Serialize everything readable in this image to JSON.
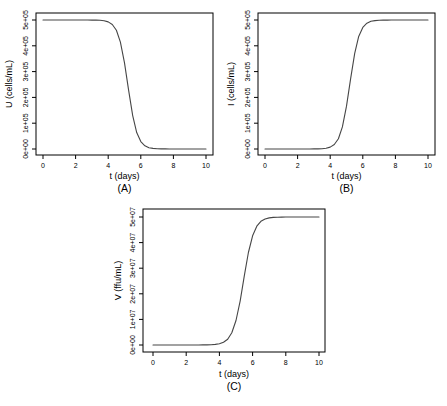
{
  "figure": {
    "background": "#ffffff",
    "axis_color": "#000000",
    "text_color": "#000000"
  },
  "chart_data": [
    {
      "id": "A",
      "type": "line",
      "caption": "(A)",
      "xlabel": "t (days)",
      "ylabel": "U (cells/mL)",
      "xlim": [
        0,
        10
      ],
      "ylim": [
        0,
        500000
      ],
      "grid": false,
      "legend": "none",
      "xtick_values": [
        0,
        2,
        4,
        6,
        8,
        10
      ],
      "xtick_labels": [
        "0",
        "2",
        "4",
        "6",
        "8",
        "10"
      ],
      "ytick_values": [
        0,
        100000,
        200000,
        300000,
        400000,
        500000
      ],
      "ytick_labels": [
        "0e+00",
        "1e+05",
        "2e+05",
        "3e+05",
        "4e+05",
        "5e+05"
      ],
      "line_color": "#464646",
      "series": [
        {
          "name": "U",
          "x": [
            0,
            0.25,
            0.5,
            0.75,
            1,
            1.25,
            1.5,
            1.75,
            2,
            2.25,
            2.5,
            2.75,
            3,
            3.25,
            3.5,
            3.75,
            4,
            4.25,
            4.5,
            4.75,
            5,
            5.25,
            5.5,
            5.75,
            6,
            6.25,
            6.5,
            6.75,
            7,
            7.25,
            7.5,
            7.75,
            8,
            8.25,
            8.5,
            8.75,
            9,
            9.25,
            9.5,
            9.75,
            10
          ],
          "y": [
            500000,
            500000,
            500000,
            500000,
            500000,
            500000,
            500000,
            500000,
            500000,
            500000,
            500000,
            499900,
            499800,
            499500,
            498700,
            496900,
            492600,
            482700,
            460300,
            414200,
            334100,
            228200,
            129600,
            63600,
            28700,
            12300,
            5200,
            2200,
            900,
            400,
            200,
            100,
            0,
            0,
            0,
            0,
            0,
            0,
            0,
            0,
            0
          ]
        }
      ]
    },
    {
      "id": "B",
      "type": "line",
      "caption": "(B)",
      "xlabel": "t (days)",
      "ylabel": "I (cells/mL)",
      "xlim": [
        0,
        10
      ],
      "ylim": [
        0,
        500000
      ],
      "grid": false,
      "legend": "none",
      "xtick_values": [
        0,
        2,
        4,
        6,
        8,
        10
      ],
      "xtick_labels": [
        "0",
        "2",
        "4",
        "6",
        "8",
        "10"
      ],
      "ytick_values": [
        0,
        100000,
        200000,
        300000,
        400000,
        500000
      ],
      "ytick_labels": [
        "0e+00",
        "1e+05",
        "2e+05",
        "3e+05",
        "4e+05",
        "5e+05"
      ],
      "line_color": "#464646",
      "series": [
        {
          "name": "I",
          "x": [
            0,
            0.25,
            0.5,
            0.75,
            1,
            1.25,
            1.5,
            1.75,
            2,
            2.25,
            2.5,
            2.75,
            3,
            3.25,
            3.5,
            3.75,
            4,
            4.25,
            4.5,
            4.75,
            5,
            5.25,
            5.5,
            5.75,
            6,
            6.25,
            6.5,
            6.75,
            7,
            7.25,
            7.5,
            7.75,
            8,
            8.25,
            8.5,
            8.75,
            9,
            9.25,
            9.5,
            9.75,
            10
          ],
          "y": [
            0,
            0,
            0,
            0,
            0,
            0,
            0,
            0,
            0,
            0,
            0,
            100,
            200,
            500,
            1300,
            3100,
            7400,
            17300,
            39700,
            85800,
            165900,
            271800,
            370400,
            436400,
            471300,
            487700,
            494800,
            497800,
            499100,
            499600,
            499800,
            499900,
            500000,
            500000,
            500000,
            500000,
            500000,
            500000,
            500000,
            500000,
            500000
          ]
        }
      ]
    },
    {
      "id": "C",
      "type": "line",
      "caption": "(C)",
      "xlabel": "t (days)",
      "ylabel": "V (ffu/mL)",
      "xlim": [
        0,
        10
      ],
      "ylim": [
        0,
        50000000
      ],
      "grid": false,
      "legend": "none",
      "xtick_values": [
        0,
        2,
        4,
        6,
        8,
        10
      ],
      "xtick_labels": [
        "0",
        "2",
        "4",
        "6",
        "8",
        "10"
      ],
      "ytick_values": [
        0,
        10000000,
        20000000,
        30000000,
        40000000,
        50000000
      ],
      "ytick_labels": [
        "0e+00",
        "1e+07",
        "2e+07",
        "3e+07",
        "4e+07",
        "5e+07"
      ],
      "line_color": "#464646",
      "series": [
        {
          "name": "V",
          "x": [
            0,
            0.25,
            0.5,
            0.75,
            1,
            1.25,
            1.5,
            1.75,
            2,
            2.25,
            2.5,
            2.75,
            3,
            3.25,
            3.5,
            3.75,
            4,
            4.25,
            4.5,
            4.75,
            5,
            5.25,
            5.5,
            5.75,
            6,
            6.25,
            6.5,
            6.75,
            7,
            7.25,
            7.5,
            7.75,
            8,
            8.25,
            8.5,
            8.75,
            9,
            9.25,
            9.5,
            9.75,
            10
          ],
          "y": [
            0,
            0,
            0,
            0,
            0,
            0,
            0,
            0,
            0,
            0,
            0,
            10000,
            20000,
            44000,
            98000,
            215000,
            480000,
            1050000,
            2280000,
            4800000,
            9570000,
            17260000,
            27000000,
            36150000,
            42660000,
            46420000,
            48320000,
            49230000,
            49650000,
            49840000,
            49930000,
            49970000,
            49990000,
            50000000,
            50000000,
            50000000,
            50000000,
            50000000,
            50000000,
            50000000,
            50000000
          ]
        }
      ]
    }
  ]
}
